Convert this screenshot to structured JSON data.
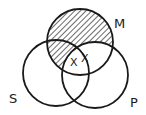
{
  "diagram": {
    "type": "venn",
    "sets": [
      {
        "id": "M",
        "label": "M",
        "cx": 80,
        "cy": 42,
        "r": 33
      },
      {
        "id": "S",
        "label": "S",
        "cx": 56,
        "cy": 73,
        "r": 33
      },
      {
        "id": "P",
        "label": "P",
        "cx": 95,
        "cy": 75,
        "r": 33
      }
    ],
    "shaded_region": "M minus P",
    "marks": [
      {
        "label": "X",
        "region": "M∩S∩P"
      },
      {
        "label": "X",
        "region": "M∩P boundary (S edge)"
      }
    ],
    "stroke_color": "#1a1a1a",
    "hatch_color": "#1a1a1a",
    "background": "#ffffff"
  },
  "labels": {
    "m": "M",
    "s": "S",
    "p": "P",
    "x1": "X",
    "x2": "X"
  }
}
